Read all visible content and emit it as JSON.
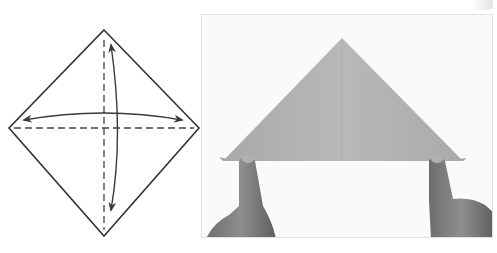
{
  "figure": {
    "type": "origami-instruction-step",
    "diagram": {
      "shape": "square-on-point",
      "fold_lines": [
        "horizontal-dashed",
        "vertical-dashed"
      ],
      "arrows": [
        "horizontal-double-arrow",
        "vertical-double-arrow"
      ],
      "stroke_color": "#3a3a3a"
    },
    "photo": {
      "subject": "hands holding paper folded into triangle",
      "paper_color": "#b3b3b3",
      "background_color": "#fafafa"
    }
  }
}
